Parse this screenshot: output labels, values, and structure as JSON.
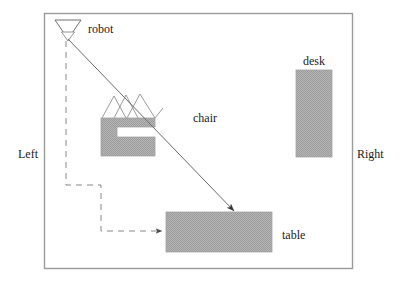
{
  "diagram": {
    "frame": {
      "x": 44,
      "y": 13,
      "width": 308,
      "height": 255,
      "stroke": "#9a9a9a",
      "fill": "#ffffff"
    },
    "colors": {
      "furniture_fill": "#a9a9a9",
      "furniture_stroke": "#a9a9a9",
      "line": "#555555",
      "dashed": "#777777",
      "frame": "#9a9a9a",
      "text": "#1a1a1a",
      "background": "#ffffff"
    },
    "labels": [
      {
        "id": "robot",
        "text": "robot",
        "x": 88,
        "y": 23
      },
      {
        "id": "desk",
        "text": "desk",
        "x": 303,
        "y": 55
      },
      {
        "id": "chair",
        "text": "chair",
        "x": 193,
        "y": 112
      },
      {
        "id": "left",
        "text": "Left",
        "x": 18,
        "y": 148
      },
      {
        "id": "right",
        "text": "Right",
        "x": 357,
        "y": 148
      },
      {
        "id": "table",
        "text": "table",
        "x": 282,
        "y": 229
      }
    ],
    "objects": [
      {
        "id": "robot",
        "shape": "triangle-down",
        "x": 55,
        "y": 20,
        "width": 26,
        "height": 18
      },
      {
        "id": "chair",
        "shape": "c-block",
        "x": 101,
        "y": 118,
        "width": 54,
        "height": 38
      },
      {
        "id": "desk",
        "shape": "rect",
        "x": 296,
        "y": 70,
        "width": 36,
        "height": 87
      },
      {
        "id": "table",
        "shape": "rect",
        "x": 166,
        "y": 212,
        "width": 106,
        "height": 40
      }
    ],
    "paths": [
      {
        "id": "line-of-sight",
        "style": "solid",
        "arrow": true,
        "from": {
          "x": 68,
          "y": 39
        },
        "to": {
          "x": 234,
          "y": 212
        }
      },
      {
        "id": "robot-route",
        "style": "dashed",
        "arrow": true,
        "points": [
          {
            "x": 66,
            "y": 41
          },
          {
            "x": 66,
            "y": 185
          },
          {
            "x": 101,
            "y": 185
          },
          {
            "x": 101,
            "y": 231
          },
          {
            "x": 164,
            "y": 231
          }
        ]
      }
    ]
  }
}
